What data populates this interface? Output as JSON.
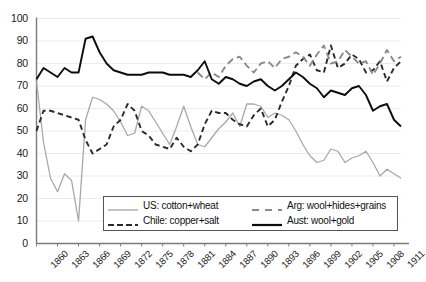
{
  "chart_data": {
    "type": "line",
    "title": "",
    "xlabel": "",
    "ylabel": "",
    "xlim": [
      1860,
      1912
    ],
    "ylim": [
      0,
      100
    ],
    "ytick_step": 10,
    "yticks": [
      0,
      10,
      20,
      30,
      40,
      50,
      60,
      70,
      80,
      90,
      100
    ],
    "xticks": [
      1860,
      1863,
      1866,
      1869,
      1872,
      1875,
      1878,
      1881,
      1884,
      1887,
      1890,
      1893,
      1896,
      1899,
      1902,
      1905,
      1908,
      1911
    ],
    "grid": true,
    "grid_axis": "y",
    "legend_position": "inside-bottom",
    "x": [
      1860,
      1861,
      1862,
      1863,
      1864,
      1865,
      1866,
      1867,
      1868,
      1869,
      1870,
      1871,
      1872,
      1873,
      1874,
      1875,
      1876,
      1877,
      1878,
      1879,
      1880,
      1881,
      1882,
      1883,
      1884,
      1885,
      1886,
      1887,
      1888,
      1889,
      1890,
      1891,
      1892,
      1893,
      1894,
      1895,
      1896,
      1897,
      1898,
      1899,
      1900,
      1901,
      1902,
      1903,
      1904,
      1905,
      1906,
      1907,
      1908,
      1909,
      1910,
      1911,
      1912
    ],
    "series": [
      {
        "name": "US: cotton+wheat",
        "color": "#a8a8a8",
        "style": "solid",
        "values": [
          72,
          45,
          29,
          23,
          31,
          28,
          10,
          55,
          65,
          64,
          62,
          59,
          54,
          48,
          49,
          61,
          59,
          54,
          49,
          44,
          52,
          61,
          52,
          44,
          43,
          47,
          51,
          54,
          58,
          52,
          62,
          62,
          61,
          56,
          58,
          57,
          55,
          50,
          44,
          39,
          36,
          37,
          42,
          41,
          36,
          38,
          39,
          41,
          36,
          30,
          33,
          31,
          29
        ]
      },
      {
        "name": "Chile: copper+salt",
        "color": "#2b2b2b",
        "style": "dashed",
        "values": [
          50,
          59,
          59,
          58,
          57,
          56,
          55,
          46,
          40,
          42,
          44,
          52,
          55,
          62,
          59,
          50,
          48,
          44,
          43,
          42,
          47,
          43,
          41,
          44,
          53,
          59,
          58,
          58,
          55,
          53,
          52,
          57,
          60,
          52,
          55,
          63,
          70,
          79,
          82,
          84,
          77,
          76,
          88,
          78,
          80,
          84,
          82,
          76,
          77,
          81,
          72,
          78,
          81
        ]
      },
      {
        "name": "Arg: wool+hides+grains",
        "color": "#8a8a8a",
        "style": "dashed",
        "values": [
          null,
          null,
          null,
          null,
          null,
          null,
          null,
          null,
          null,
          null,
          null,
          null,
          null,
          null,
          null,
          null,
          null,
          null,
          null,
          null,
          null,
          null,
          null,
          76,
          73,
          76,
          74,
          79,
          82,
          83,
          79,
          76,
          80,
          81,
          78,
          82,
          83,
          85,
          83,
          79,
          84,
          88,
          80,
          81,
          86,
          83,
          80,
          81,
          75,
          80,
          86,
          81,
          83
        ]
      },
      {
        "name": "Aust: wool+gold",
        "color": "#0d0d0d",
        "style": "solid",
        "values": [
          73,
          78,
          76,
          74,
          78,
          76,
          76,
          91,
          92,
          85,
          80,
          77,
          76,
          75,
          75,
          75,
          76,
          76,
          76,
          75,
          75,
          75,
          74,
          77,
          81,
          73,
          71,
          74,
          73,
          71,
          70,
          72,
          73,
          70,
          68,
          70,
          73,
          76,
          74,
          71,
          69,
          65,
          68,
          67,
          66,
          69,
          70,
          66,
          59,
          61,
          62,
          55,
          52
        ]
      }
    ]
  },
  "legend": {
    "entries": [
      {
        "label": "US: cotton+wheat",
        "color": "#a8a8a8",
        "style": "solid"
      },
      {
        "label": "Chile: copper+salt",
        "color": "#2b2b2b",
        "style": "dashed"
      },
      {
        "label": "Arg: wool+hides+grains",
        "color": "#8a8a8a",
        "style": "dashed"
      },
      {
        "label": "Aust: wool+gold",
        "color": "#0d0d0d",
        "style": "solid"
      }
    ]
  },
  "axes": {
    "y_tick_labels": [
      "100",
      "90",
      "80",
      "70",
      "60",
      "50",
      "40",
      "30",
      "20",
      "10",
      "0"
    ],
    "x_tick_labels": [
      "1860",
      "1863",
      "1866",
      "1869",
      "1872",
      "1875",
      "1878",
      "1881",
      "1884",
      "1887",
      "1890",
      "1893",
      "1896",
      "1899",
      "1902",
      "1905",
      "1908",
      "1911"
    ]
  }
}
